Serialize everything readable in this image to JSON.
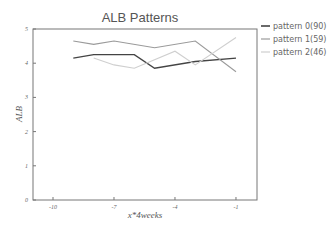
{
  "chart_data": {
    "type": "line",
    "title": "ALB Patterns",
    "xlabel": "x*4weeks",
    "ylabel": "ALB",
    "xlim": [
      -11,
      -0.0
    ],
    "ylim": [
      0,
      5
    ],
    "xticks": [
      -10,
      -7,
      -4,
      -1
    ],
    "xtick_labels": [
      "-10",
      "-7",
      "-4",
      "-1"
    ],
    "yticks": [
      0,
      1,
      2,
      3,
      4,
      5
    ],
    "ytick_labels": [
      "0",
      "1",
      "2",
      "3",
      "4",
      "5"
    ],
    "grid": false,
    "legend_position": "outside-top-right",
    "series": [
      {
        "name": "pattern 0(90)",
        "color": "#444444",
        "x": [
          -9,
          -8,
          -6,
          -5,
          -3,
          -1
        ],
        "values": [
          4.15,
          4.25,
          4.25,
          3.85,
          4.05,
          4.15
        ]
      },
      {
        "name": "pattern 1(59)",
        "color": "#9a9a9a",
        "x": [
          -9,
          -8,
          -7,
          -5,
          -3,
          -1
        ],
        "values": [
          4.65,
          4.55,
          4.65,
          4.45,
          4.65,
          3.75
        ]
      },
      {
        "name": "pattern 2(46)",
        "color": "#cfcfcf",
        "x": [
          -8,
          -7,
          -6,
          -4,
          -3,
          -1
        ],
        "values": [
          4.15,
          3.95,
          3.85,
          4.35,
          3.95,
          4.75
        ]
      }
    ]
  }
}
